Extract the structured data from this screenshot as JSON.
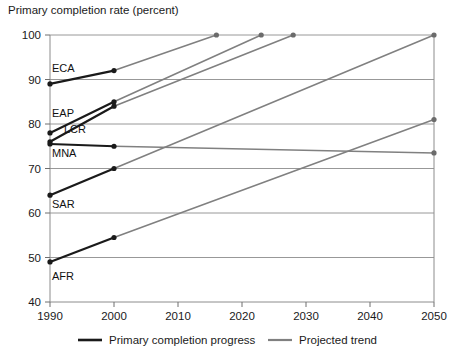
{
  "chart_data": {
    "type": "line",
    "title": "Primary completion rate (percent)",
    "xlabel": "",
    "ylabel": "",
    "xlim": [
      1990,
      2050
    ],
    "ylim": [
      40,
      100
    ],
    "xticks": [
      1990,
      2000,
      2010,
      2020,
      2030,
      2040,
      2050
    ],
    "yticks": [
      40,
      50,
      60,
      70,
      80,
      90,
      100
    ],
    "grid": "horizontal",
    "legend_position": "bottom",
    "legend": [
      {
        "label": "Primary completion progress",
        "color": "#1a1a1a"
      },
      {
        "label": "Projected trend",
        "color": "#808080"
      }
    ],
    "series": [
      {
        "name": "ECA",
        "label": "ECA",
        "progress": [
          {
            "x": 1990,
            "y": 89
          },
          {
            "x": 2000,
            "y": 92
          }
        ],
        "projection": [
          {
            "x": 2000,
            "y": 92
          },
          {
            "x": 2016,
            "y": 100
          }
        ]
      },
      {
        "name": "EAP",
        "label": "EAP",
        "progress": [
          {
            "x": 1990,
            "y": 78
          },
          {
            "x": 2000,
            "y": 85
          }
        ],
        "projection": [
          {
            "x": 2000,
            "y": 85
          },
          {
            "x": 2023,
            "y": 100
          }
        ]
      },
      {
        "name": "LCR",
        "label": "LCR",
        "progress": [
          {
            "x": 1990,
            "y": 76
          },
          {
            "x": 2000,
            "y": 84
          }
        ],
        "projection": [
          {
            "x": 2000,
            "y": 84
          },
          {
            "x": 2028,
            "y": 100
          }
        ]
      },
      {
        "name": "MNA",
        "label": "MNA",
        "progress": [
          {
            "x": 1990,
            "y": 75.5
          },
          {
            "x": 2000,
            "y": 75
          }
        ],
        "projection": [
          {
            "x": 2000,
            "y": 75
          },
          {
            "x": 2050,
            "y": 73.5
          }
        ]
      },
      {
        "name": "SAR",
        "label": "SAR",
        "progress": [
          {
            "x": 1990,
            "y": 64
          },
          {
            "x": 2000,
            "y": 70
          }
        ],
        "projection": [
          {
            "x": 2000,
            "y": 70
          },
          {
            "x": 2050,
            "y": 100
          }
        ]
      },
      {
        "name": "AFR",
        "label": "AFR",
        "progress": [
          {
            "x": 1990,
            "y": 49
          },
          {
            "x": 2000,
            "y": 54.5
          }
        ],
        "projection": [
          {
            "x": 2000,
            "y": 54.5
          },
          {
            "x": 2050,
            "y": 81
          }
        ]
      }
    ],
    "series_label_positions": [
      {
        "name": "ECA",
        "x": 52,
        "y": 72
      },
      {
        "name": "EAP",
        "x": 52,
        "y": 117
      },
      {
        "name": "LCR",
        "x": 64,
        "y": 133
      },
      {
        "name": "MNA",
        "x": 52,
        "y": 157
      },
      {
        "name": "SAR",
        "x": 52,
        "y": 208
      },
      {
        "name": "AFR",
        "x": 52,
        "y": 280
      }
    ]
  }
}
